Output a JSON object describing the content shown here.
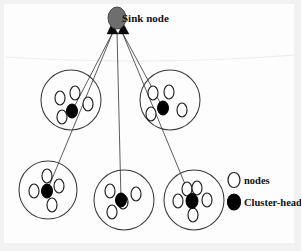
{
  "figure": {
    "width": 301,
    "height": 251,
    "background_color": "#fdfdfd"
  },
  "sink": {
    "label": "Sink node",
    "shape": "ellipse",
    "fill_color": "#6e6e6e",
    "stroke_color": "#4a4a4a",
    "cx": 117,
    "cy": 18,
    "rx": 9,
    "ry": 11
  },
  "legend": {
    "items": [
      {
        "label": "nodes",
        "symbol": "white-ellipse",
        "fill_color": "#ffffff",
        "stroke_color": "#1c1c1c",
        "cx": 234,
        "cy": 180,
        "rx": 6,
        "ry": 7.5,
        "text_x": 244,
        "text_y": 184
      },
      {
        "label": "Cluster-heads",
        "symbol": "black-ellipse",
        "fill_color": "#000000",
        "stroke_color": "#000000",
        "cx": 234,
        "cy": 202,
        "rx": 6.5,
        "ry": 8,
        "text_x": 244,
        "text_y": 206
      }
    ]
  },
  "clusters": [
    {
      "name": "cluster-top-left",
      "circle": {
        "cx": 71,
        "cy": 100,
        "r": 30,
        "stroke_color": "#3a3a3a"
      },
      "head": {
        "cx": 72,
        "cy": 111,
        "rx": 5.5,
        "ry": 7
      },
      "nodes": [
        {
          "cx": 60,
          "cy": 98,
          "rx": 5,
          "ry": 7
        },
        {
          "cx": 75,
          "cy": 93,
          "rx": 5,
          "ry": 7
        },
        {
          "cx": 88,
          "cy": 104,
          "rx": 5,
          "ry": 7
        },
        {
          "cx": 62,
          "cy": 117,
          "rx": 5,
          "ry": 7
        }
      ]
    },
    {
      "name": "cluster-top-right",
      "circle": {
        "cx": 170,
        "cy": 100,
        "r": 30,
        "stroke_color": "#3a3a3a"
      },
      "head": {
        "cx": 163,
        "cy": 108,
        "rx": 5.5,
        "ry": 7
      },
      "nodes": [
        {
          "cx": 153,
          "cy": 93,
          "rx": 5,
          "ry": 7
        },
        {
          "cx": 169,
          "cy": 92,
          "rx": 5,
          "ry": 7
        },
        {
          "cx": 182,
          "cy": 110,
          "rx": 5,
          "ry": 7
        },
        {
          "cx": 151,
          "cy": 114,
          "rx": 5,
          "ry": 7
        }
      ]
    },
    {
      "name": "cluster-bottom-left",
      "circle": {
        "cx": 48,
        "cy": 190,
        "r": 29,
        "stroke_color": "#3a3a3a"
      },
      "head": {
        "cx": 47,
        "cy": 191,
        "rx": 5.5,
        "ry": 7
      },
      "nodes": [
        {
          "cx": 47,
          "cy": 176,
          "rx": 5,
          "ry": 7
        },
        {
          "cx": 34,
          "cy": 191,
          "rx": 5,
          "ry": 7
        },
        {
          "cx": 59,
          "cy": 186,
          "rx": 5,
          "ry": 7
        },
        {
          "cx": 52,
          "cy": 205,
          "rx": 5,
          "ry": 7
        }
      ]
    },
    {
      "name": "cluster-bottom-middle",
      "circle": {
        "cx": 124,
        "cy": 200,
        "r": 30,
        "stroke_color": "#3a3a3a"
      },
      "head": {
        "cx": 121,
        "cy": 200,
        "rx": 5.5,
        "ry": 7
      },
      "nodes": [
        {
          "cx": 110,
          "cy": 191,
          "rx": 5,
          "ry": 7
        },
        {
          "cx": 136,
          "cy": 194,
          "rx": 5,
          "ry": 7
        },
        {
          "cx": 123,
          "cy": 202,
          "rx": 5,
          "ry": 7
        },
        {
          "cx": 112,
          "cy": 212,
          "rx": 5,
          "ry": 7
        }
      ]
    },
    {
      "name": "cluster-bottom-right",
      "circle": {
        "cx": 194,
        "cy": 200,
        "r": 30,
        "stroke_color": "#3a3a3a"
      },
      "head": {
        "cx": 192,
        "cy": 201,
        "rx": 6,
        "ry": 7.5
      },
      "nodes": [
        {
          "cx": 187,
          "cy": 189,
          "rx": 5,
          "ry": 7
        },
        {
          "cx": 197,
          "cy": 188,
          "rx": 5,
          "ry": 7
        },
        {
          "cx": 178,
          "cy": 201,
          "rx": 5,
          "ry": 7
        },
        {
          "cx": 207,
          "cy": 200,
          "rx": 5,
          "ry": 7
        },
        {
          "cx": 193,
          "cy": 215,
          "rx": 5,
          "ry": 7
        }
      ]
    }
  ],
  "links": [
    {
      "name": "link-sink-to-top-left",
      "x1": 113,
      "y1": 32,
      "x2": 72,
      "y2": 111
    },
    {
      "name": "link-sink-to-bottom-left",
      "x1": 113,
      "y1": 32,
      "x2": 47,
      "y2": 191
    },
    {
      "name": "link-sink-to-bottom-middle",
      "x1": 117,
      "y1": 32,
      "x2": 121,
      "y2": 200
    },
    {
      "name": "link-sink-to-top-right",
      "x1": 122,
      "y1": 32,
      "x2": 163,
      "y2": 108
    },
    {
      "name": "link-sink-to-bottom-right",
      "x1": 122,
      "y1": 32,
      "x2": 192,
      "y2": 201
    }
  ],
  "arrows": [
    {
      "name": "arrow-left-into-sink",
      "points": "107,34 118,34 112,23"
    },
    {
      "name": "arrow-right-into-sink",
      "points": "118,34 129,34 123,23"
    }
  ]
}
